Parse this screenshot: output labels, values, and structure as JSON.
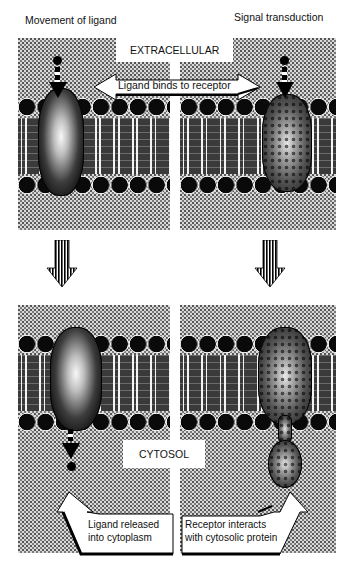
{
  "figure": {
    "panels": {
      "top_left": {
        "title": "Movement of ligand"
      },
      "top_right": {
        "title": "Signal transduction"
      }
    },
    "labels": {
      "extracellular": "EXTRACELLULAR",
      "cytosol": "CYTOSOL",
      "ligand_binds": "Ligand binds to receptor",
      "ligand_released_line1": "Ligand released",
      "ligand_released_line2": "into cytoplasm",
      "receptor_interacts_line1": "Receptor interacts",
      "receptor_interacts_line2": "with cytosolic protein"
    },
    "transition_arrows": [
      "down-arrow-left",
      "down-arrow-right"
    ],
    "colors": {
      "background": "#ffffff",
      "stipple": "#d9d9d9",
      "ink": "#000000"
    }
  }
}
